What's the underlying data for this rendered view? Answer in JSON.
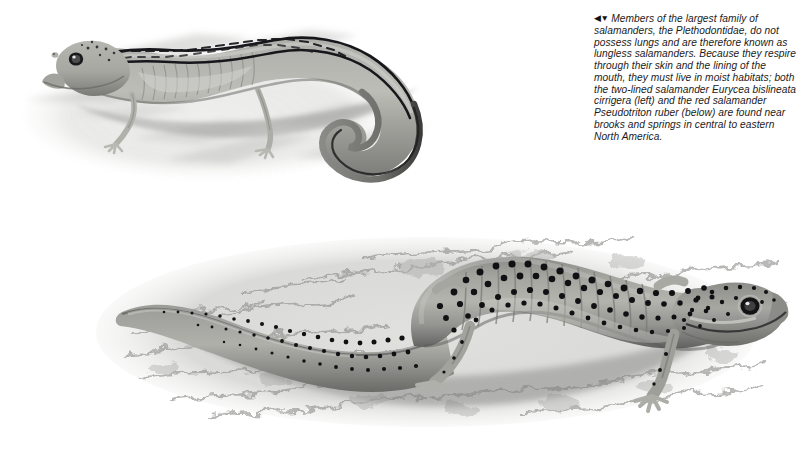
{
  "page": {
    "background_color": "#ffffff",
    "width": 803,
    "height": 449,
    "kind": "textbook-illustration-plate"
  },
  "caption": {
    "arrows": "◀▼",
    "arrow_names": [
      "left-triangle-icon",
      "down-triangle-icon"
    ],
    "text": "Members of the largest family of salamanders, the Plethodontidae, do not possess lungs and are therefore known as lungless salamanders. Because they respire through their skin and the lining of the mouth, they must live in moist habitats; both the two-lined salamander Eurycea bislineata cirrigera (left) and the red salamander Pseudotriton ruber (below) are found near brooks and springs in central to eastern North America.",
    "lines": [
      "Members of the largest family of",
      "salamanders, the Plethodontidae, do",
      "not possess lungs and are therefore",
      "known as lungless salamanders.",
      "Because they respire through their skin",
      "and the lining of the mouth, they must",
      "live in moist habitats; both the two-lined",
      "salamander Eurycea bislineata",
      "cirrigera (left) and the red salamander",
      "Pseudotriton ruber (below) are found",
      "near brooks and springs in central to",
      "eastern North America."
    ],
    "text_color": "#1b1b1b",
    "style": "italic"
  },
  "figures": [
    {
      "id": "two-lined-salamander",
      "common_name": "two-lined salamander",
      "scientific_name": "Eurycea bislineata cirrigera",
      "position_label": "left",
      "description": "Grayscale illustration of a slender salamander on pale rock, head at upper left, long S-curved tail sweeping to the lower right, dark dorsolateral stripes flanking a light dorsal band.",
      "body_color": "#9a9a96",
      "stripe_color": "#16161a",
      "background_color": "#cfcfcc"
    },
    {
      "id": "red-salamander",
      "common_name": "red salamander",
      "scientific_name": "Pseudotriton ruber",
      "position_label": "below",
      "description": "Grayscale illustration of a stout, heavily black-spotted salamander on mottled gravel, head at right with a dark round eye, thick tail tapering to the left.",
      "body_color": "#8f8f8b",
      "spot_color": "#121214",
      "background_color": "#d8d8d5"
    }
  ]
}
